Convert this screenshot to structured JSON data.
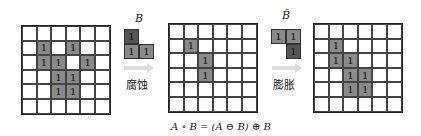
{
  "diagram": {
    "grid_A": {
      "rows": [
        [
          "",
          "",
          "",
          "",
          "",
          ""
        ],
        [
          "",
          "1",
          "",
          "1",
          "",
          ""
        ],
        [
          "",
          "1",
          "1",
          "",
          "1",
          ""
        ],
        [
          "",
          "",
          "1",
          "1",
          "",
          ""
        ],
        [
          "",
          "",
          "1",
          "1",
          "",
          ""
        ],
        [
          "",
          "",
          "",
          "",
          "",
          ""
        ]
      ]
    },
    "grid_eroded": {
      "rows": [
        [
          "",
          "",
          "",
          "",
          "",
          ""
        ],
        [
          "",
          "1",
          "",
          "",
          "",
          ""
        ],
        [
          "",
          "",
          "1",
          "",
          "",
          ""
        ],
        [
          "",
          "",
          "1",
          "",
          "",
          ""
        ],
        [
          "",
          "",
          "",
          "",
          "",
          ""
        ],
        [
          "",
          "",
          "",
          "",
          "",
          ""
        ]
      ]
    },
    "grid_opened": {
      "rows": [
        [
          "",
          "",
          "",
          "",
          "",
          ""
        ],
        [
          "",
          "1",
          "",
          "",
          "",
          ""
        ],
        [
          "",
          "1",
          "1",
          "",
          "",
          ""
        ],
        [
          "",
          "",
          "1",
          "1",
          "",
          ""
        ],
        [
          "",
          "",
          "1",
          "1",
          "",
          ""
        ],
        [
          "",
          "",
          "",
          "",
          "",
          ""
        ]
      ]
    },
    "structuring_element_B": {
      "label": "B",
      "cells": [
        {
          "value": "1",
          "style": "dark"
        },
        {
          "value": "",
          "style": "off"
        },
        {
          "value": "1",
          "style": "gray"
        },
        {
          "value": "1",
          "style": "gray"
        }
      ]
    },
    "structuring_element_B_hat": {
      "label": "B̂",
      "cells": [
        {
          "value": "1",
          "style": "gray"
        },
        {
          "value": "1",
          "style": "gray"
        },
        {
          "value": "",
          "style": "off"
        },
        {
          "value": "1",
          "style": "dark"
        }
      ]
    },
    "erosion_label": "腐蚀",
    "dilation_label": "膨胀",
    "formula": "A ∘ B = (A ⊖ B) ⊕ B"
  },
  "colors": {
    "cell_gray": "#8a8a8a",
    "cell_dark": "#555555",
    "arrow": "#dddddd"
  }
}
